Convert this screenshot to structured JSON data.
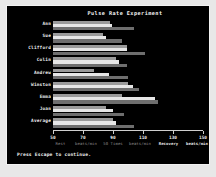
{
  "window": {
    "title": "Pulse Rate Experiment",
    "footer": "Press Escape to continue."
  },
  "colors": {
    "background": "#000000",
    "frame": "#f2f2f2",
    "page": "#e8e8e8",
    "text": "#f2f2f2",
    "axis": "#cfcfcf",
    "series_rest": "#9a9a9a",
    "series_fifty_times": "#e6e6e6",
    "series_recovery": "#6e6e6e"
  },
  "chart_data": {
    "type": "bar",
    "orientation": "horizontal",
    "title": "Pulse Rate Experiment",
    "xlabel": "",
    "ylabel": "",
    "xlim": [
      50,
      150
    ],
    "grid": false,
    "legend_position": "below-axis",
    "xticks": [
      50,
      70,
      90,
      110,
      130,
      150
    ],
    "xticklabels": [
      "50",
      "70",
      "90",
      "110",
      "130",
      "150"
    ],
    "axis_group_labels": [
      {
        "text": "Rest",
        "at": 55,
        "style": "dim"
      },
      {
        "text": "beats/min",
        "at": 72,
        "style": "dim"
      },
      {
        "text": "50 Times",
        "at": 90,
        "style": "dim"
      },
      {
        "text": "beats/min",
        "at": 108,
        "style": "dim"
      },
      {
        "text": "Recovery",
        "at": 127,
        "style": "bright"
      },
      {
        "text": "beats/min",
        "at": 146,
        "style": "bright"
      }
    ],
    "categories": [
      "Ann",
      "Sue",
      "Clifford",
      "Colin",
      "Andrew",
      "Winston",
      "Emma",
      "Joan",
      "Average"
    ],
    "series": [
      {
        "name": "Rest",
        "color": "#9a9a9a",
        "values": [
          88,
          83,
          99,
          92,
          77,
          100,
          96,
          85,
          90
        ]
      },
      {
        "name": "50 Times",
        "color": "#e6e6e6",
        "values": [
          89,
          85,
          99,
          94,
          87,
          103,
          118,
          90,
          92
        ]
      },
      {
        "name": "Recovery",
        "color": "#6e6e6e",
        "values": [
          104,
          96,
          111,
          99,
          100,
          107,
          120,
          97,
          104
        ]
      }
    ]
  }
}
